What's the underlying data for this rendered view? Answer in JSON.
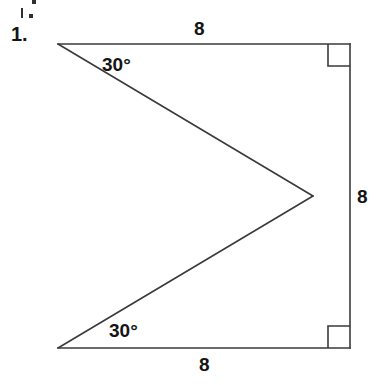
{
  "page": {
    "background_color": "#ffffff",
    "width": 383,
    "height": 385
  },
  "problem": {
    "number_label": "1."
  },
  "figure": {
    "stroke_color": "#3a3a3a",
    "stroke_width": 1.6,
    "fill": "none",
    "vertices": {
      "top_left": {
        "x": 58,
        "y": 44
      },
      "top_right": {
        "x": 350,
        "y": 44
      },
      "apex_middle_right": {
        "x": 313,
        "y": 196
      },
      "bottom_right": {
        "x": 350,
        "y": 348
      },
      "bottom_left": {
        "x": 58,
        "y": 348
      }
    },
    "segments": [
      {
        "name": "top-edge",
        "from": "top_left",
        "to": "top_right"
      },
      {
        "name": "right-edge",
        "from": "top_right",
        "to": "bottom_right"
      },
      {
        "name": "bottom-edge",
        "from": "bottom_right",
        "to": "bottom_left"
      },
      {
        "name": "lower-diagonal",
        "from": "bottom_left",
        "to": "apex_middle_right"
      },
      {
        "name": "upper-diagonal",
        "from": "apex_middle_right",
        "to": "top_left"
      }
    ],
    "right_angle_markers": [
      {
        "name": "top-right-angle",
        "x": 328,
        "y": 44,
        "size": 22
      },
      {
        "name": "bottom-right-angle",
        "x": 328,
        "y": 326,
        "size": 22
      }
    ]
  },
  "labels": {
    "top_length": "8",
    "right_length": "8",
    "bottom_length": "8",
    "top_angle": "30°",
    "bottom_angle": "30°"
  },
  "colors": {
    "ink": "#141414",
    "line": "#3a3a3a",
    "background": "#ffffff"
  }
}
